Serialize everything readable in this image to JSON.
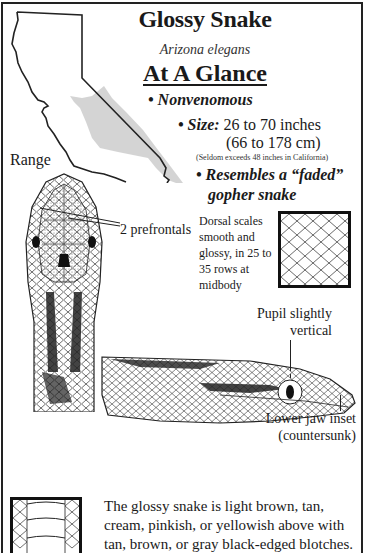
{
  "header": {
    "title": "Glossy Snake",
    "scientific_name": "Arizona elegans",
    "subtitle": "At A Glance"
  },
  "facts": {
    "venom": "Nonvenomous",
    "size_label": "Size:",
    "size_inches": "26 to 70 inches",
    "size_cm": "(66 to 178 cm)",
    "size_note": "(Seldom exceeds 48 inches in California)",
    "resembles_line1": "Resembles a “faded”",
    "resembles_line2": "gopher snake"
  },
  "map": {
    "label": "Range",
    "outline_color": "#222222",
    "range_fill_color": "#cccccc"
  },
  "head_diagram": {
    "callout": "2 prefrontals"
  },
  "dorsal_scales": {
    "text": "Dorsal scales smooth and glossy, in 25 to 35 rows at midbody"
  },
  "side_view": {
    "pupil_callout_line1": "Pupil slightly",
    "pupil_callout_line2": "vertical",
    "jaw_callout_line1": "Lower jaw inset",
    "jaw_callout_line2": "(countersunk)"
  },
  "description": {
    "text": "The glossy snake is light brown, tan, cream, pinkish, or yellowish above with tan, brown, or gray black-edged blotches."
  }
}
